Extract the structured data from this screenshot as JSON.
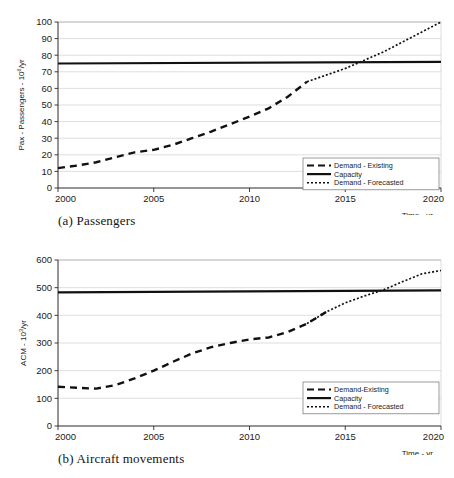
{
  "figure": {
    "panels": [
      {
        "id": "a",
        "caption": "(a) Passengers",
        "chart_data": {
          "type": "line",
          "title": "",
          "xlabel": "Time - yr",
          "ylabel": "Pax - Passengers - 10⁶/yr",
          "ylabel_base": "Pax - Passengers - 10",
          "ylabel_exp": "6",
          "ylabel_suffix": "/yr",
          "xlim": [
            2000,
            2020
          ],
          "ylim": [
            0,
            100
          ],
          "xticks": [
            2000,
            2005,
            2010,
            2015,
            2020
          ],
          "yticks": [
            0,
            10,
            20,
            30,
            40,
            50,
            60,
            70,
            80,
            90,
            100
          ],
          "grid": "horizontal",
          "legend_position": "bottom-right",
          "series": [
            {
              "name": "Demand - Existing",
              "style": "dashed",
              "x": [
                2000,
                2001,
                2002,
                2003,
                2004,
                2005,
                2006,
                2007,
                2008,
                2009,
                2010,
                2011,
                2012,
                2013
              ],
              "values": [
                12,
                13.5,
                15.5,
                18.5,
                21.5,
                23,
                26,
                30,
                34,
                38.5,
                43,
                48,
                55,
                64
              ]
            },
            {
              "name": "Capacity",
              "style": "solid",
              "x": [
                2000,
                2020
              ],
              "values": [
                75,
                76
              ]
            },
            {
              "name": "Demand - Forecasted",
              "style": "dotted",
              "x": [
                2013,
                2014,
                2015,
                2016,
                2017,
                2018,
                2019,
                2020
              ],
              "values": [
                64,
                68,
                72,
                77,
                82,
                88,
                94,
                100
              ]
            }
          ],
          "annotations": [
            {
              "text": "Demand crosses capacity near 2015",
              "x": 2015,
              "y": 75
            }
          ]
        }
      },
      {
        "id": "b",
        "caption": "(b) Aircraft movements",
        "chart_data": {
          "type": "line",
          "title": "",
          "xlabel": "Time - yr",
          "ylabel": "ACM - 10³/yr",
          "ylabel_base": "ACM - 10",
          "ylabel_exp": "3",
          "ylabel_suffix": "/yr",
          "xlim": [
            2000,
            2020
          ],
          "ylim": [
            0,
            600
          ],
          "xticks": [
            2000,
            2005,
            2010,
            2015,
            2020
          ],
          "yticks": [
            0,
            100,
            200,
            300,
            400,
            500,
            600
          ],
          "grid": "horizontal",
          "legend_position": "bottom-right",
          "series": [
            {
              "name": "Demand-Existing",
              "style": "dashed",
              "x": [
                2000,
                2001,
                2002,
                2003,
                2004,
                2005,
                2006,
                2007,
                2008,
                2009,
                2010,
                2011,
                2012,
                2013,
                2014
              ],
              "values": [
                142,
                138,
                135,
                148,
                172,
                200,
                232,
                262,
                285,
                300,
                313,
                320,
                340,
                370,
                412
              ]
            },
            {
              "name": "Capacity",
              "style": "solid",
              "x": [
                2000,
                2020
              ],
              "values": [
                483,
                490
              ]
            },
            {
              "name": "Demand - Forecasted",
              "style": "dotted",
              "x": [
                2013,
                2014,
                2015,
                2016,
                2017,
                2018,
                2019,
                2020
              ],
              "values": [
                370,
                412,
                445,
                470,
                492,
                522,
                550,
                562
              ]
            }
          ],
          "annotations": [
            {
              "text": "Demand crosses capacity near 2017",
              "x": 2017,
              "y": 488
            }
          ]
        }
      }
    ]
  }
}
